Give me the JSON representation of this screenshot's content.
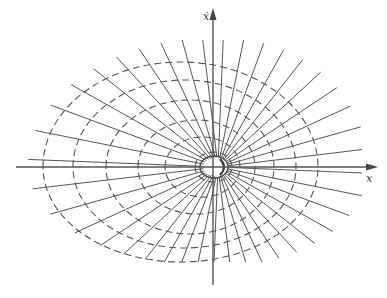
{
  "figure": {
    "axes": {
      "horizontal_label": "x",
      "vertical_label": "ẋ"
    },
    "colors": {
      "line": "#555555",
      "axis": "#555555",
      "background": "#ffffff"
    },
    "geometry": {
      "origin": [
        213,
        167
      ],
      "focus": [
        218,
        167
      ],
      "x_axis": {
        "x1": 16,
        "x2": 378,
        "y": 167
      },
      "y_axis": {
        "x": 213,
        "y1": 8,
        "y2": 285
      },
      "radial_line_count": 40,
      "dashed_curves": [
        {
          "left": 43,
          "right": 318,
          "top": 62,
          "bottom": 262
        },
        {
          "left": 73,
          "right": 296,
          "top": 80,
          "bottom": 248
        },
        {
          "left": 106,
          "right": 274,
          "top": 100,
          "bottom": 234
        },
        {
          "left": 138,
          "right": 255,
          "top": 120,
          "bottom": 214
        },
        {
          "left": 165,
          "right": 240,
          "top": 137,
          "bottom": 197
        },
        {
          "left": 195,
          "right": 232,
          "top": 152,
          "bottom": 182
        }
      ]
    }
  }
}
